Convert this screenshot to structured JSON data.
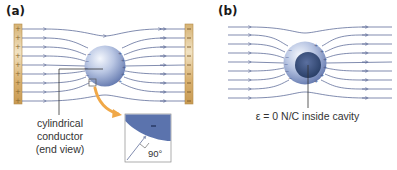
{
  "panels": {
    "a": {
      "label": "(a)",
      "left_plate_sign": "+",
      "right_plate_sign": "−",
      "conductor_caption_lines": [
        "cylindrical",
        "conductor",
        "(end view)"
      ],
      "inset_angle": "90°",
      "inset_charge": "−"
    },
    "b": {
      "label": "(b)",
      "cavity_caption": "ε = 0 N/C inside cavity"
    }
  },
  "colors": {
    "field_line": "#4a5a8c",
    "plate_fill": "#d9b67a",
    "plate_edge": "#b08a4a",
    "sphere_light": "#e6ecf7",
    "sphere_dark": "#6f84b8",
    "cavity": "#2f4778",
    "callout_arrow": "#f0a848",
    "inset_fill": "#5b73ad"
  },
  "field_line_count": 9
}
